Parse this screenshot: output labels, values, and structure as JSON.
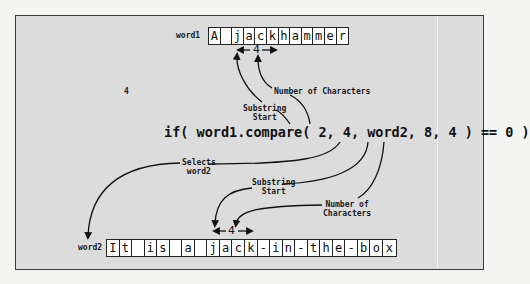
{
  "diagram": {
    "word1": {
      "label": "word1",
      "chars": [
        "A",
        " ",
        "j",
        "a",
        "c",
        "k",
        "h",
        "a",
        "m",
        "m",
        "e",
        "r"
      ]
    },
    "word2": {
      "label": "word2",
      "chars": [
        "I",
        "t",
        " ",
        "i",
        "s",
        " ",
        "a",
        " ",
        "j",
        "a",
        "c",
        "k",
        "-",
        "i",
        "n",
        "-",
        "t",
        "h",
        "e",
        "-",
        "b",
        "o",
        "x"
      ]
    },
    "code": "if( word1.compare( 2, 4, word2, 8, 4 ) == 0 )",
    "stray_number": "4",
    "span_length_word1": "4",
    "span_length_word2": "4",
    "annotations": {
      "word1_length": "Number of Characters",
      "word1_start_line1": "Substring",
      "word1_start_line2": "Start",
      "selects_line1": "Selects",
      "selects_line2": "word2",
      "word2_start_line1": "Substring",
      "word2_start_line2": "Start",
      "word2_length_line1": "Number of",
      "word2_length_line2": "Characters"
    },
    "colors": {
      "panel": "#dcdcdc",
      "border": "#3a3a3a",
      "cell_bg": "#ffffff",
      "ink": "#111111"
    }
  }
}
